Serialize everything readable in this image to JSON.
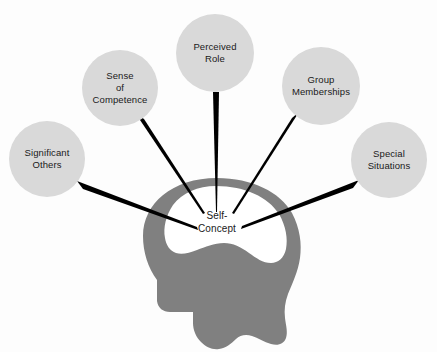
{
  "diagram": {
    "background_color": "#fdfdfd",
    "head_color": "#808080",
    "cavity_color": "#ffffff",
    "circle_color": "#d9d9d9",
    "connector_color": "#000000",
    "text_color": "#1a1a1a",
    "center": {
      "name": "self-concept",
      "line1": "Self-",
      "line2": "Concept"
    },
    "nodes": [
      {
        "name": "significant-others",
        "lines": [
          "Significant",
          "Others"
        ],
        "cx": 47,
        "cy": 159,
        "r": 38
      },
      {
        "name": "sense-of-competence",
        "lines": [
          "Sense",
          "of",
          "Competence"
        ],
        "cx": 120,
        "cy": 88,
        "r": 38
      },
      {
        "name": "perceived-role",
        "lines": [
          "Perceived",
          "Role"
        ],
        "cx": 215,
        "cy": 53,
        "r": 39
      },
      {
        "name": "group-memberships",
        "lines": [
          "Group",
          "Memberships"
        ],
        "cx": 321,
        "cy": 86,
        "r": 39
      },
      {
        "name": "special-situations",
        "lines": [
          "Special",
          "Situations"
        ],
        "cx": 389,
        "cy": 160,
        "r": 38
      }
    ]
  }
}
